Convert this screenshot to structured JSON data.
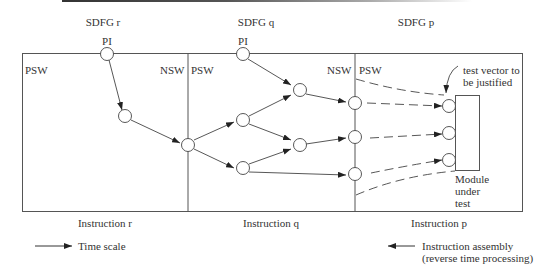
{
  "sdfg": {
    "r": "SDFG  r",
    "q": "SDFG  q",
    "p": "SDFG  p"
  },
  "labels": {
    "pi_r": "PI",
    "pi_q": "PI",
    "psw": "PSW",
    "nsw": "NSW",
    "test_vector_line1": "test vector to",
    "test_vector_line2": "be justified",
    "module_line1": "Module",
    "module_line2": "under",
    "module_line3": "test"
  },
  "instructions": {
    "r": "Instruction  r",
    "q": "Instruction  q",
    "p": "Instruction  p"
  },
  "legend": {
    "time_scale": "Time scale",
    "assembly_line1": "Instruction assembly",
    "assembly_line2": "(reverse time processing)"
  }
}
